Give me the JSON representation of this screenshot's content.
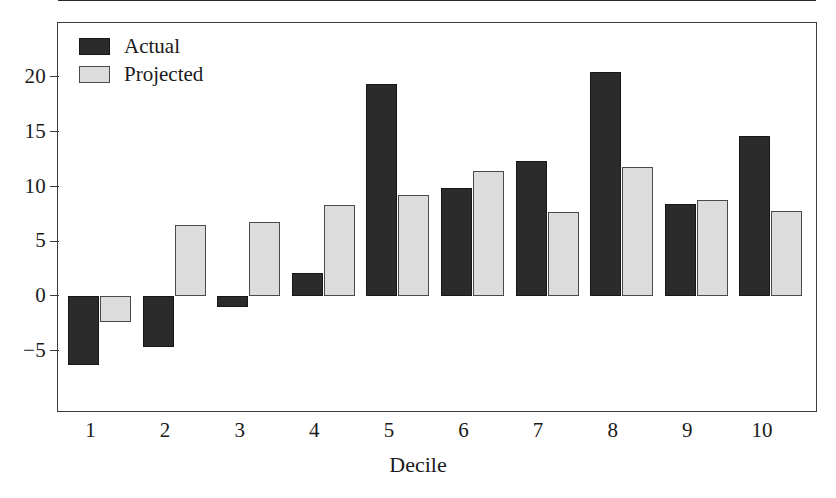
{
  "chart_data": {
    "type": "bar",
    "title": "",
    "xlabel": "Decile",
    "ylabel": "",
    "categories": [
      "1",
      "2",
      "3",
      "4",
      "5",
      "6",
      "7",
      "8",
      "9",
      "10"
    ],
    "series": [
      {
        "name": "Actual",
        "color": "#2b2b2b",
        "values": [
          -6.3,
          -4.7,
          -1.0,
          2.1,
          19.4,
          9.9,
          12.3,
          20.5,
          8.4,
          14.6
        ]
      },
      {
        "name": "Projected",
        "color": "#dcdcdc",
        "values": [
          -2.4,
          6.5,
          6.8,
          8.3,
          9.2,
          11.4,
          7.7,
          11.8,
          8.8,
          7.8
        ]
      }
    ],
    "yticks": [
      20,
      15,
      10,
      5,
      0,
      -5
    ],
    "ytick_labels": [
      "20",
      "15",
      "10",
      "5",
      "0",
      "−5"
    ],
    "ylim": [
      -8.5,
      23.4
    ],
    "grid": false,
    "legend_position": "top-left",
    "frame": true
  },
  "legend": {
    "items": [
      {
        "label": "Actual",
        "swatch": "dark-square-swatch"
      },
      {
        "label": "Projected",
        "swatch": "light-square-swatch"
      }
    ]
  },
  "axes": {
    "x_title": "Decile",
    "x_labels": [
      "1",
      "2",
      "3",
      "4",
      "5",
      "6",
      "7",
      "8",
      "9",
      "10"
    ],
    "y_labels": [
      "20",
      "15",
      "10",
      "5",
      "0",
      "−5"
    ]
  }
}
